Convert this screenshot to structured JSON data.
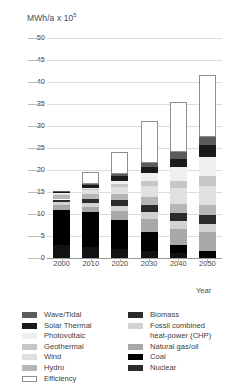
{
  "chart": {
    "type": "bar",
    "axis_title": "MWh/a x 10",
    "axis_title_exponent": "5",
    "xlabel": "Year"
  },
  "chart_data": {
    "type": "bar",
    "subtitle": "",
    "xlabel": "Year",
    "ylabel": "MWh/a x 10^5",
    "ylim": [
      0,
      50
    ],
    "ytick_values": [
      0,
      5,
      10,
      15,
      20,
      25,
      30,
      35,
      40,
      45,
      50
    ],
    "ytick_labels": [
      "0",
      "5",
      "10",
      "15",
      "20",
      "25",
      "30",
      "35",
      "40",
      "45",
      "50"
    ],
    "grid": true,
    "legend_position": "bottom",
    "stacked": true,
    "categories": [
      "2000",
      "2010",
      "2020",
      "2030",
      "2040",
      "2050"
    ],
    "series": [
      {
        "name": "Nuclear",
        "color": "#121212",
        "values": [
          3.0,
          2.6,
          2.0,
          1.6,
          1.2,
          0.0
        ]
      },
      {
        "name": "Coal",
        "color": "#000000",
        "values": [
          8.0,
          7.8,
          6.6,
          4.4,
          1.8,
          1.6
        ]
      },
      {
        "name": "Natural gas/oil",
        "color": "#a8a8a8",
        "values": [
          1.1,
          1.3,
          2.0,
          2.9,
          3.7,
          4.4
        ]
      },
      {
        "name": "Fossil combined heat-power (CHP)",
        "color": "#d2d2d2",
        "values": [
          0.6,
          0.8,
          1.3,
          1.6,
          1.8,
          1.8
        ]
      },
      {
        "name": "Biomass",
        "color": "#2b2b2b",
        "values": [
          0.6,
          0.9,
          1.2,
          1.5,
          1.8,
          2.0
        ]
      },
      {
        "name": "Hydro",
        "color": "#b6b6b6",
        "values": [
          1.0,
          1.1,
          1.5,
          1.8,
          2.0,
          2.2
        ]
      },
      {
        "name": "Wind",
        "color": "#e0e0e0",
        "values": [
          0.2,
          0.9,
          1.6,
          2.6,
          3.6,
          4.4
        ]
      },
      {
        "name": "Geothermal",
        "color": "#c6c6c6",
        "values": [
          0.1,
          0.3,
          0.6,
          1.1,
          1.7,
          2.2
        ]
      },
      {
        "name": "Photovoltaic",
        "color": "#efefef",
        "values": [
          0.1,
          0.3,
          0.8,
          1.8,
          3.0,
          4.4
        ]
      },
      {
        "name": "Solar Thermal",
        "color": "#1a1a1a",
        "values": [
          0.2,
          0.6,
          1.0,
          1.4,
          2.0,
          2.6
        ]
      },
      {
        "name": "Wave/Tidal",
        "color": "#5c5c5c",
        "values": [
          0.1,
          0.2,
          0.4,
          0.8,
          1.4,
          2.0
        ]
      },
      {
        "name": "Efficiency",
        "color": "#ffffff",
        "values": [
          0.0,
          2.8,
          5.2,
          9.6,
          11.5,
          13.9
        ]
      }
    ],
    "totals": [
      15.0,
      19.6,
      24.2,
      31.1,
      35.5,
      41.5
    ],
    "annotations": []
  },
  "legend": {
    "left_column": [
      {
        "label": "Wave/Tidal",
        "color": "#5c5c5c",
        "hollow": false
      },
      {
        "label": "Solar Thermal",
        "color": "#1a1a1a",
        "hollow": false
      },
      {
        "label": "Photovoltaic",
        "color": "#efefef",
        "hollow": false
      },
      {
        "label": "Geothermal",
        "color": "#c6c6c6",
        "hollow": false
      },
      {
        "label": "Wind",
        "color": "#e0e0e0",
        "hollow": false
      },
      {
        "label": "Hydro",
        "color": "#b6b6b6",
        "hollow": false
      },
      {
        "label": "Efficiency",
        "color": "#ffffff",
        "hollow": true
      }
    ],
    "right_column": [
      {
        "label": "Biomass",
        "color": "#2b2b2b",
        "hollow": false
      },
      {
        "label": "Fossil combined",
        "color": "#d2d2d2",
        "hollow": false
      },
      {
        "label": "heat-power (CHP)",
        "color": "",
        "hollow": false,
        "continuation": true
      },
      {
        "label": "Natural gas/oil",
        "color": "#a8a8a8",
        "hollow": false
      },
      {
        "label": "Coal",
        "color": "#000000",
        "hollow": false
      },
      {
        "label": "Nuclear",
        "color": "#2b2b2b",
        "hollow": false
      }
    ]
  }
}
